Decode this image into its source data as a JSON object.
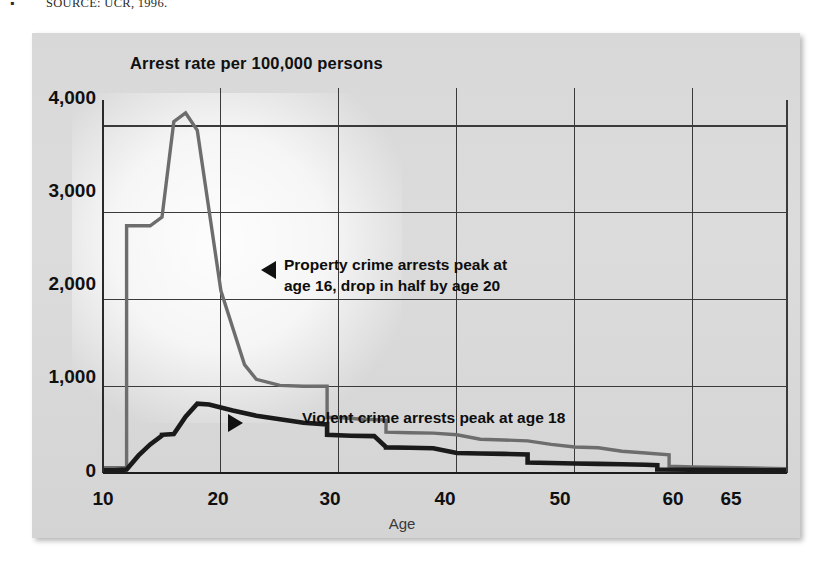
{
  "source_note": {
    "bullet": "▪",
    "text": "SOURCE: UCR, 1996."
  },
  "chart_data": {
    "type": "line",
    "title": "Arrest rate per 100,000 persons",
    "xlabel": "Age",
    "ylabel": "",
    "xlim": [
      10,
      68
    ],
    "ylim": [
      0,
      4300
    ],
    "grid": true,
    "legend_position": "none",
    "xticks": [
      10,
      20,
      30,
      40,
      50,
      60,
      65
    ],
    "xtick_labels": [
      "10",
      "20",
      "30",
      "40",
      "50",
      "60",
      "65"
    ],
    "yticks": [
      0,
      1000,
      2000,
      3000,
      4000
    ],
    "ytick_labels": [
      "0",
      "1,000",
      "2,000",
      "3,000",
      "4,000"
    ],
    "series": [
      {
        "name": "Property crime arrest rate",
        "color": "#6d6d6d",
        "x": [
          10,
          11,
          12,
          12,
          14,
          15,
          16,
          17,
          18,
          20,
          22,
          23,
          25,
          27,
          29,
          29,
          30,
          32,
          34,
          34,
          36,
          38,
          40,
          42,
          44,
          46,
          48,
          50,
          52,
          54,
          56,
          58,
          58,
          60,
          64,
          68
        ],
        "y": [
          60,
          60,
          60,
          2850,
          2850,
          2950,
          4050,
          4150,
          3950,
          2100,
          1250,
          1080,
          1010,
          1000,
          1000,
          640,
          640,
          620,
          610,
          470,
          465,
          460,
          440,
          390,
          380,
          370,
          330,
          300,
          290,
          250,
          230,
          210,
          80,
          70,
          60,
          50
        ]
      },
      {
        "name": "Violent crime arrest rate",
        "color": "#1a1a1a",
        "x": [
          10,
          11,
          12,
          13,
          14,
          15,
          15,
          16,
          17,
          18,
          19,
          21,
          23,
          25,
          27,
          29,
          29,
          31,
          33,
          34,
          34,
          36,
          38,
          40,
          42,
          44,
          46,
          46,
          48,
          50,
          52,
          54,
          56,
          57,
          57,
          60,
          64,
          68
        ],
        "y": [
          30,
          30,
          40,
          200,
          330,
          430,
          440,
          450,
          650,
          800,
          790,
          720,
          660,
          620,
          580,
          560,
          440,
          430,
          425,
          300,
          295,
          290,
          285,
          230,
          225,
          220,
          215,
          120,
          115,
          110,
          105,
          100,
          95,
          90,
          40,
          38,
          35,
          30
        ]
      }
    ],
    "annotations": [
      {
        "id": "property-peak",
        "marker": "triangle-left",
        "lines": [
          "Property crime arrests peak at",
          "age 16, drop in half by age 20"
        ]
      },
      {
        "id": "violent-peak",
        "marker": "triangle-right",
        "lines": [
          "Violent crime arrests peak at age 18"
        ]
      }
    ]
  }
}
